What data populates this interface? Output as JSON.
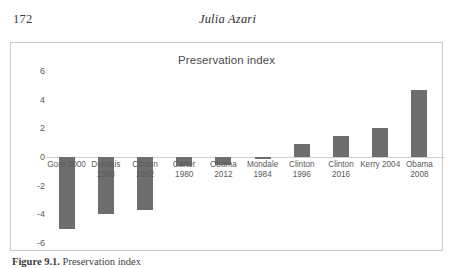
{
  "page": {
    "folio": "172",
    "running_head": "Julia Azari"
  },
  "figure": {
    "caption_label": "Figure 9.1.",
    "caption_text": " Preservation index"
  },
  "chart_data": {
    "type": "bar",
    "title": "Preservation index",
    "xlabel": "",
    "ylabel": "",
    "ylim": [
      -6,
      6
    ],
    "yticks": [
      6,
      4,
      2,
      0,
      -2,
      -4,
      -6
    ],
    "ytick_labels": [
      "6",
      "4",
      "2",
      "0",
      "-2",
      "-4",
      "-6"
    ],
    "grid": false,
    "legend": "none",
    "bar_color": "#6e6e6e",
    "axis_color": "#d0d0d0",
    "categories": [
      "Gore 2000",
      "Dukakis 1988",
      "Clinton 1992",
      "Carter 1980",
      "Obama 2012",
      "Mondale 1984",
      "Clinton 1996",
      "Clinton 2016",
      "Kerry 2004",
      "Obama 2008"
    ],
    "category_lines": [
      "Gore 2000",
      "Dukakis\n1988",
      "Clinton\n1992",
      "Carter\n1980",
      "Obama\n2012",
      "Mondale\n1984",
      "Clinton\n1996",
      "Clinton\n2016",
      "Kerry 2004",
      "Obama\n2008"
    ],
    "values": [
      -5.0,
      -4.0,
      -3.7,
      -0.6,
      -0.55,
      -0.15,
      0.9,
      1.5,
      2.0,
      4.7
    ]
  }
}
